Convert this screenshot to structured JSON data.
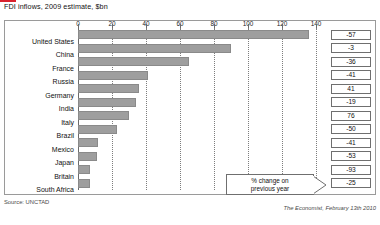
{
  "chart_data": {
    "type": "bar",
    "orientation": "horizontal",
    "title": "FDI inflows, 2009 estimate, $bn",
    "xlabel": "",
    "ylabel": "",
    "xlim": [
      0,
      140
    ],
    "ticks": [
      0,
      20,
      40,
      60,
      80,
      100,
      120,
      140
    ],
    "grid": true,
    "legend": null,
    "categories": [
      "United States",
      "China",
      "France",
      "Russia",
      "Germany",
      "India",
      "Italy",
      "Brazil",
      "Mexico",
      "Japan",
      "Britain",
      "South Africa"
    ],
    "values": [
      136,
      90,
      65,
      41,
      36,
      34,
      30,
      23,
      12,
      11,
      7,
      7
    ],
    "series": [
      {
        "name": "FDI inflows, 2009 estimate, $bn",
        "values": [
          136,
          90,
          65,
          41,
          36,
          34,
          30,
          23,
          12,
          11,
          7,
          7
        ]
      },
      {
        "name": "% change on previous year",
        "values": [
          -57,
          -3,
          -36,
          -41,
          41,
          -19,
          76,
          -50,
          -41,
          -53,
          -93,
          -25
        ]
      }
    ],
    "annotations": {
      "callout": "% change on previous year"
    },
    "change_labels": [
      "-57",
      "-3",
      "-36",
      "-41",
      "41",
      "-19",
      "76",
      "-50",
      "-41",
      "-53",
      "-93",
      "-25"
    ],
    "tick_labels": [
      "0",
      "20",
      "40",
      "60",
      "80",
      "100",
      "120",
      "140"
    ],
    "colors": {
      "bar": "#9e9e9e",
      "bar_border": "#8a8a8a",
      "grid": "#7d7d7d",
      "frame": "#9a9a9a",
      "accent": "#d9232e",
      "text": "#111111"
    }
  },
  "footer": {
    "source": "Source: UNCTAD",
    "credit": "The Economist, February 13th 2010"
  },
  "callout": {
    "line1": "% change on",
    "line2": "previous year"
  }
}
